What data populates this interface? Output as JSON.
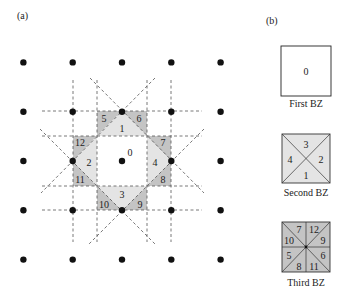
{
  "panel_a": {
    "label": "(a)",
    "lattice": {
      "origin": [
        122,
        161
      ],
      "spacing": 49.3,
      "rows": 5,
      "cols": 5
    },
    "zone_labels": [
      {
        "id": "0",
        "x": 130,
        "y": 152
      },
      {
        "id": "1",
        "x": 122,
        "y": 128
      },
      {
        "id": "2",
        "x": 89,
        "y": 162
      },
      {
        "id": "3",
        "x": 122,
        "y": 194
      },
      {
        "id": "4",
        "x": 155,
        "y": 162
      },
      {
        "id": "5",
        "x": 104,
        "y": 118
      },
      {
        "id": "6",
        "x": 139,
        "y": 118
      },
      {
        "id": "7",
        "x": 163,
        "y": 142
      },
      {
        "id": "8",
        "x": 163,
        "y": 179
      },
      {
        "id": "9",
        "x": 140,
        "y": 204
      },
      {
        "id": "10",
        "x": 104,
        "y": 204
      },
      {
        "id": "11",
        "x": 80,
        "y": 179
      },
      {
        "id": "12",
        "x": 80,
        "y": 142
      }
    ]
  },
  "panel_b": {
    "label": "(b)",
    "zones": [
      {
        "caption": "First BZ",
        "labels": [
          "0"
        ]
      },
      {
        "caption": "Second BZ",
        "labels": [
          "3",
          "2",
          "1",
          "4"
        ]
      },
      {
        "caption": "Third BZ",
        "labels": [
          "7",
          "12",
          "9",
          "6",
          "11",
          "8",
          "5",
          "10"
        ]
      }
    ]
  },
  "colors": {
    "first_zone": "#ffffff",
    "second_zone": "#e4e4e4",
    "third_zone": "#c4c4c4",
    "dot": "#111111",
    "dashed_line": "#555555"
  }
}
